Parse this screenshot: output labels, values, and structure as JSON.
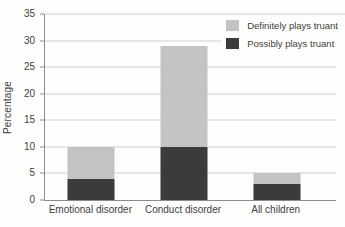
{
  "chart_data": {
    "type": "bar",
    "stacked": true,
    "title": "",
    "xlabel": "",
    "ylabel": "Percentage",
    "categories": [
      "Emotional disorder",
      "Conduct disorder",
      "All children"
    ],
    "series": [
      {
        "name": "Possibly plays truant",
        "color": "#3b3b3b",
        "values": [
          4,
          10,
          3
        ]
      },
      {
        "name": "Definitely plays truant",
        "color": "#c3c3c3",
        "values": [
          6,
          19,
          2
        ]
      }
    ],
    "totals": [
      10,
      29,
      5
    ],
    "ylim": [
      0,
      35
    ],
    "yticks": [
      0,
      5,
      10,
      15,
      20,
      25,
      30,
      35
    ],
    "grid": true,
    "gridline_color": "#cfcfce",
    "axis_color": "#8c8c8c",
    "text_color": "#3d3d3d",
    "background_color": "#fdfdfb",
    "legend_position": "top-right",
    "legend_order": [
      "Definitely plays truant",
      "Possibly plays truant"
    ]
  }
}
